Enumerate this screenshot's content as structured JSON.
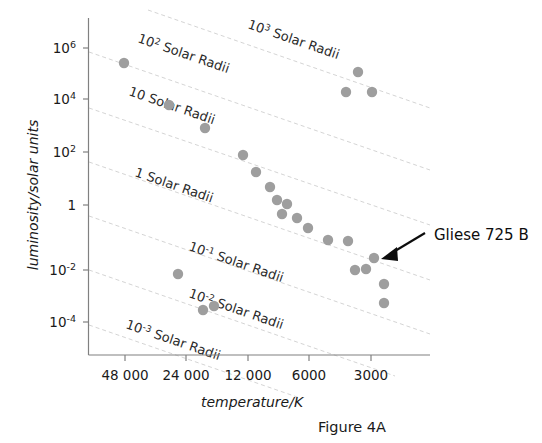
{
  "figure": {
    "caption": "Figure 4A",
    "background_color": "#ffffff",
    "point_color": "#9e9e9e",
    "gridline_color": "#cfcfcf",
    "axis_color": "#808080",
    "annotation_color": "#0d0d0d"
  },
  "chart_data": {
    "type": "scatter",
    "title": "",
    "subtitle": "",
    "xlabel": "temperature/K",
    "ylabel": "luminosity/solar units",
    "xscale": "log-reversed",
    "yscale": "log",
    "xlim": [
      60000,
      2000
    ],
    "ylim": [
      1e-05,
      10000000.0
    ],
    "grid": false,
    "legend": "none",
    "xticks": [
      {
        "value": 48000,
        "label": "48 000"
      },
      {
        "value": 24000,
        "label": "24 000"
      },
      {
        "value": 12000,
        "label": "12 000"
      },
      {
        "value": 6000,
        "label": "6000"
      },
      {
        "value": 3000,
        "label": "3000"
      }
    ],
    "yticks": [
      {
        "value": 1000000,
        "mantissa": "10",
        "exponent": "6",
        "label": "10⁶"
      },
      {
        "value": 10000,
        "mantissa": "10",
        "exponent": "4",
        "label": "10⁴"
      },
      {
        "value": 100,
        "mantissa": "10",
        "exponent": "2",
        "label": "10²"
      },
      {
        "value": 1,
        "mantissa": "1",
        "exponent": "",
        "label": "1"
      },
      {
        "value": 0.01,
        "mantissa": "10",
        "exponent": "-2",
        "label": "10⁻²"
      },
      {
        "value": 0.0001,
        "mantissa": "10",
        "exponent": "-4",
        "label": "10⁻⁴"
      }
    ],
    "series": [
      {
        "name": "stars",
        "points": [
          {
            "x": 48000,
            "y": 250000
          },
          {
            "x": 27000,
            "y": 5000
          },
          {
            "x": 19500,
            "y": 800
          },
          {
            "x": 12500,
            "y": 80
          },
          {
            "x": 10500,
            "y": 22
          },
          {
            "x": 9000,
            "y": 5
          },
          {
            "x": 8000,
            "y": 2.2
          },
          {
            "x": 7200,
            "y": 1.2
          },
          {
            "x": 6600,
            "y": 0.6
          },
          {
            "x": 6000,
            "y": 0.35
          },
          {
            "x": 5200,
            "y": 0.1
          },
          {
            "x": 4600,
            "y": 0.05
          },
          {
            "x": 3300,
            "y": 0.006
          },
          {
            "x": 3000,
            "y": 0.0045
          },
          {
            "x": 2800,
            "y": 0.004
          },
          {
            "x": 2600,
            "y": 0.0008
          },
          {
            "x": 2500,
            "y": 0.00035
          },
          {
            "x": 3400,
            "y": 20000
          },
          {
            "x": 3600,
            "y": 3000
          },
          {
            "x": 2900,
            "y": 3000
          },
          {
            "x": 26000,
            "y": 0.0035
          },
          {
            "x": 20000,
            "y": 0.00013
          },
          {
            "x": 17000,
            "y": 0.00018
          }
        ]
      }
    ],
    "reference_lines": [
      {
        "id": "r1000",
        "mantissa": "10",
        "exponent": "3",
        "label": "10³ Solar Radii",
        "radius": 1000
      },
      {
        "id": "r100",
        "mantissa": "10",
        "exponent": "2",
        "label": "10² Solar Radii",
        "radius": 100
      },
      {
        "id": "r10",
        "mantissa": "10",
        "exponent": "",
        "label": "10 Solar Radii",
        "radius": 10
      },
      {
        "id": "r1",
        "mantissa": "1",
        "exponent": "",
        "label": "1 Solar Radii",
        "radius": 1
      },
      {
        "id": "r0.1",
        "mantissa": "10",
        "exponent": "-1",
        "label": "10⁻¹ Solar Radii",
        "radius": 0.1
      },
      {
        "id": "r0.01",
        "mantissa": "10",
        "exponent": "-2",
        "label": "10⁻² Solar Radii",
        "radius": 0.01
      },
      {
        "id": "r0.001",
        "mantissa": "10",
        "exponent": "-3",
        "label": "10⁻³ Solar Radii",
        "radius": 0.001
      }
    ],
    "annotations": [
      {
        "id": "gliese-725-b",
        "text": "Gliese 725 B",
        "target_x": 3000,
        "target_y": 0.0045
      }
    ]
  }
}
